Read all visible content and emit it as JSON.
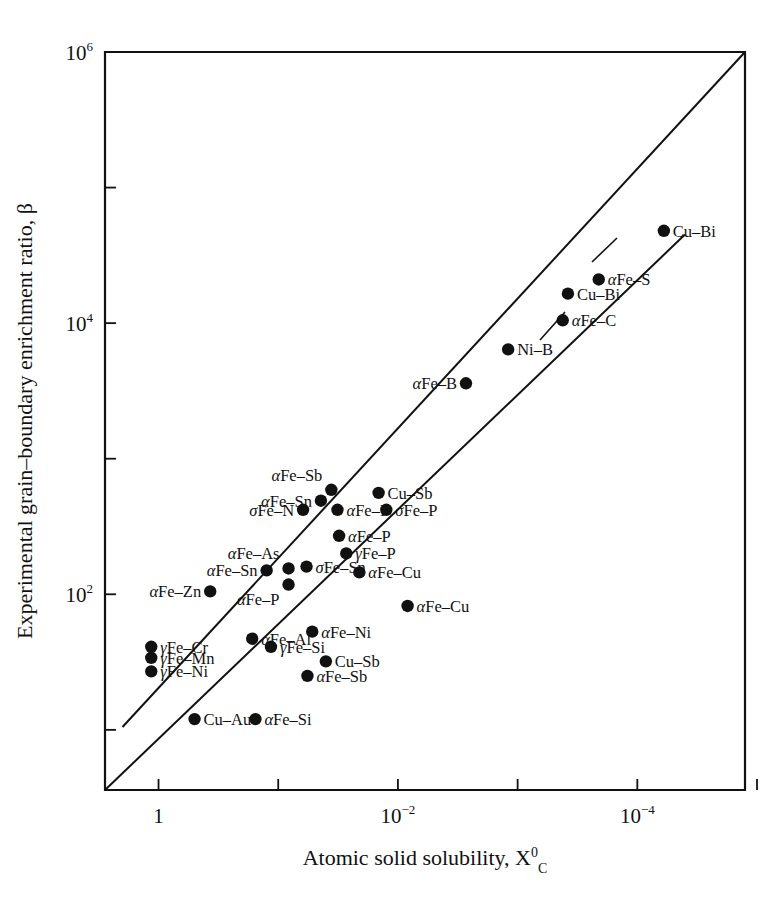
{
  "chart_data": {
    "type": "scatter",
    "title": "",
    "xlabel": "Atomic solid solubility, X",
    "xlabel_sub": "C",
    "xlabel_sup": "0",
    "ylabel": "Experimental grain–boundary enrichment ratio, β",
    "xlabel_full": "Atomic solid solubility, Xᴄ⁰",
    "x_scale": "log",
    "y_scale": "log",
    "xlim": [
      2.8,
      1.26e-05
    ],
    "ylim": [
      3.6,
      1000000
    ],
    "x_ticks": [
      {
        "value": 1,
        "label": "1",
        "mantissa": "1",
        "exponent": ""
      },
      {
        "value": 0.01,
        "label": "10-2",
        "mantissa": "10",
        "exponent": "−2"
      },
      {
        "value": 0.0001,
        "label": "10-4",
        "mantissa": "10",
        "exponent": "−4"
      }
    ],
    "x_minor_ticks": [
      0.1,
      0.001,
      1e-05
    ],
    "y_ticks": [
      {
        "value": 1000000,
        "label": "106",
        "mantissa": "10",
        "exponent": "6"
      },
      {
        "value": 10000,
        "label": "104",
        "mantissa": "10",
        "exponent": "4"
      },
      {
        "value": 100,
        "label": "102",
        "mantissa": "10",
        "exponent": "2"
      }
    ],
    "y_minor_ticks": [
      100000,
      1000,
      10
    ],
    "grid": false,
    "legend": "none",
    "marker": "filled-circle",
    "marker_color": "#111111",
    "trend_lines": [
      {
        "name": "upper-bound-line",
        "x1": 2.0,
        "y1": 10.5,
        "x2": 1.26e-05,
        "y2": 1000000
      },
      {
        "name": "lower-bound-line",
        "x1": 2.8,
        "y1": 3.6,
        "x2": 4e-05,
        "y2": 45000
      }
    ],
    "points": [
      {
        "label": "γFe–Cr",
        "x": 1.15,
        "y": 41,
        "label_pos": "right"
      },
      {
        "label": "γFe–Mn",
        "x": 1.15,
        "y": 34,
        "label_pos": "right"
      },
      {
        "label": "γFe–Ni",
        "x": 1.15,
        "y": 27,
        "label_pos": "right"
      },
      {
        "label": "Cu–Au",
        "x": 0.5,
        "y": 12,
        "label_pos": "right"
      },
      {
        "label": "αFe–Si",
        "x": 0.155,
        "y": 12,
        "label_pos": "right"
      },
      {
        "label": "αFe–Al",
        "x": 0.165,
        "y": 47,
        "label_pos": "right"
      },
      {
        "label": "γFe–Si",
        "x": 0.115,
        "y": 41,
        "label_pos": "right"
      },
      {
        "label": "αFe–Ni",
        "x": 0.052,
        "y": 53,
        "label_pos": "right"
      },
      {
        "label": "Cu–Sb",
        "x": 0.04,
        "y": 32,
        "label_pos": "right"
      },
      {
        "label": "αFe–Sb",
        "x": 0.057,
        "y": 25,
        "label_pos": "right"
      },
      {
        "label": "αFe–Zn",
        "x": 0.37,
        "y": 105,
        "label_pos": "left"
      },
      {
        "label": "αFe–Sn",
        "x": 0.125,
        "y": 150,
        "label_pos": "left"
      },
      {
        "label": "αFe–As",
        "x": 0.082,
        "y": 155,
        "label_pos": "above"
      },
      {
        "label": "αFe–P",
        "x": 0.082,
        "y": 118,
        "label_pos": "below"
      },
      {
        "label": "σFe–Sn",
        "x": 0.058,
        "y": 160,
        "label_pos": "right"
      },
      {
        "label": "σFe–N",
        "x": 0.062,
        "y": 420,
        "label_pos": "left"
      },
      {
        "label": "αFe–Sn",
        "x": 0.044,
        "y": 490,
        "label_pos": "left"
      },
      {
        "label": "αFe–Sb",
        "x": 0.036,
        "y": 590,
        "label_pos": "above"
      },
      {
        "label": "αFe–P",
        "x": 0.032,
        "y": 420,
        "label_pos": "right"
      },
      {
        "label": "αFe–P",
        "x": 0.031,
        "y": 270,
        "label_pos": "right"
      },
      {
        "label": "γFe–P",
        "x": 0.027,
        "y": 200,
        "label_pos": "right"
      },
      {
        "label": "αFe–Cu",
        "x": 0.021,
        "y": 145,
        "label_pos": "right"
      },
      {
        "label": "αFe–Cu",
        "x": 0.0083,
        "y": 82,
        "label_pos": "right"
      },
      {
        "label": "σFe–P",
        "x": 0.0125,
        "y": 420,
        "label_pos": "right"
      },
      {
        "label": "Cu–Sb",
        "x": 0.0145,
        "y": 560,
        "label_pos": "right"
      },
      {
        "label": "αFe–B",
        "x": 0.0027,
        "y": 3600,
        "label_pos": "left"
      },
      {
        "label": "Ni–B",
        "x": 0.0012,
        "y": 6400,
        "label_pos": "right"
      },
      {
        "label": "αFe–C",
        "x": 0.00042,
        "y": 10500,
        "label_pos": "right"
      },
      {
        "label": "Cu–Bi",
        "x": 0.00038,
        "y": 16500,
        "label_pos": "right"
      },
      {
        "label": "αFe–S",
        "x": 0.00021,
        "y": 21000,
        "label_pos": "right"
      },
      {
        "label": "Cu–Bi",
        "x": 6e-05,
        "y": 48000,
        "label_pos": "right"
      }
    ],
    "leader_lines": [
      {
        "from_label": "αFe–C",
        "x1": 540,
        "y1": 340,
        "x2": 565,
        "y2": 312
      },
      {
        "from_label": "Cu–Bi-upper",
        "x1": 592,
        "y1": 262,
        "x2": 617,
        "y2": 238
      }
    ]
  }
}
